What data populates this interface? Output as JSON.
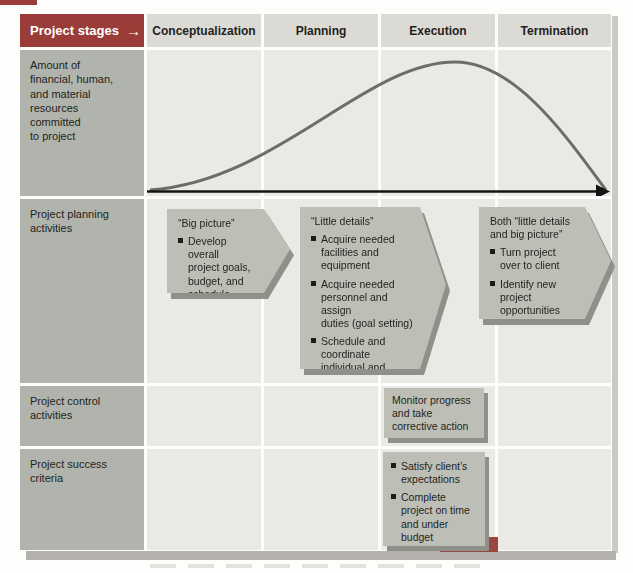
{
  "header": {
    "label": "Project stages",
    "arrow_glyph": "→",
    "stages": [
      "Conceptualization",
      "Planning",
      "Execution",
      "Termination"
    ]
  },
  "row_labels": {
    "resources": "Amount of\nfinancial, human,\nand material\nresources\ncommitted\nto project",
    "planning": "Project planning\nactivities",
    "control": "Project control\nactivities",
    "success": "Project success\ncriteria"
  },
  "planning_boxes": {
    "big_picture": {
      "title": "“Big picture”",
      "bullets": [
        "Develop overall\nproject goals,\nbudget, and\nschedule"
      ]
    },
    "little_details": {
      "title": "“Little details”",
      "bullets": [
        "Acquire needed\nfacilities and\nequipment",
        "Acquire needed\npersonnel and assign\nduties (goal setting)",
        "Schedule and\ncoordinate\nindividual and\nteam efforts"
      ]
    },
    "both": {
      "title": "Both “little details\nand big picture”",
      "bullets": [
        "Turn project\nover to client",
        "Identify new\nproject\nopportunities"
      ]
    }
  },
  "control_box": {
    "text": "Monitor progress\nand take\ncorrective action"
  },
  "success_box": {
    "bullets": [
      "Satisfy client’s\nexpectations",
      "Complete\nproject on time\nand under\nbudget"
    ]
  },
  "resource_curve": {
    "type": "line",
    "ylabel": "Amount of financial, human, and material resources committed to project",
    "x_stages": [
      "Conceptualization",
      "Planning",
      "Execution",
      "Termination"
    ],
    "shape": "bell curve: low at start of Conceptualization, rising through Planning, peaking early-mid Execution, falling to zero at end of Termination",
    "relative_levels": {
      "Conceptualization": 0.1,
      "Planning": 0.55,
      "Execution": 1.0,
      "Termination": 0.3
    }
  },
  "colors": {
    "maroon": "#9a3c37",
    "label_cell": "#b1b4ac",
    "stage_header_cell": "#dcdad5",
    "grid_cell": "#eae9e5",
    "box_fill": "#bdbfb6",
    "box_shadow": "#8e9089",
    "curve": "#6d6d68",
    "axis": "#141414"
  }
}
